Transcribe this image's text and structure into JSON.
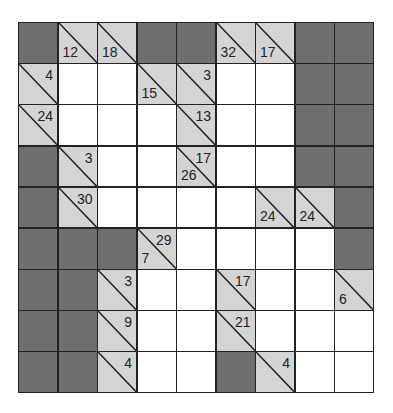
{
  "puzzle": {
    "type": "kakuro",
    "rows": 9,
    "cols": 9,
    "colors": {
      "block": "#6f6f6f",
      "clue": "#d4d4d4",
      "entry": "#ffffff",
      "line": "#222222"
    },
    "grid": [
      [
        {
          "t": "D"
        },
        {
          "t": "C",
          "down": "12"
        },
        {
          "t": "C",
          "down": "18"
        },
        {
          "t": "D"
        },
        {
          "t": "D"
        },
        {
          "t": "C",
          "down": "32"
        },
        {
          "t": "C",
          "down": "17"
        },
        {
          "t": "D"
        },
        {
          "t": "D"
        }
      ],
      [
        {
          "t": "C",
          "right": "4"
        },
        {
          "t": "W"
        },
        {
          "t": "W"
        },
        {
          "t": "C",
          "down": "15"
        },
        {
          "t": "C",
          "right": "3"
        },
        {
          "t": "W"
        },
        {
          "t": "W"
        },
        {
          "t": "D"
        },
        {
          "t": "D"
        }
      ],
      [
        {
          "t": "C",
          "right": "24"
        },
        {
          "t": "W"
        },
        {
          "t": "W"
        },
        {
          "t": "W"
        },
        {
          "t": "C",
          "right": "13"
        },
        {
          "t": "W"
        },
        {
          "t": "W"
        },
        {
          "t": "D"
        },
        {
          "t": "D"
        }
      ],
      [
        {
          "t": "D"
        },
        {
          "t": "C",
          "right": "3"
        },
        {
          "t": "W"
        },
        {
          "t": "W"
        },
        {
          "t": "C",
          "right": "17",
          "down": "26"
        },
        {
          "t": "W"
        },
        {
          "t": "W"
        },
        {
          "t": "D"
        },
        {
          "t": "D"
        }
      ],
      [
        {
          "t": "D"
        },
        {
          "t": "C",
          "right": "30"
        },
        {
          "t": "W"
        },
        {
          "t": "W"
        },
        {
          "t": "W"
        },
        {
          "t": "W"
        },
        {
          "t": "C",
          "down": "24"
        },
        {
          "t": "C",
          "down": "24"
        },
        {
          "t": "D"
        }
      ],
      [
        {
          "t": "D"
        },
        {
          "t": "D"
        },
        {
          "t": "D"
        },
        {
          "t": "C",
          "right": "29",
          "down": "7"
        },
        {
          "t": "W"
        },
        {
          "t": "W"
        },
        {
          "t": "W"
        },
        {
          "t": "W"
        },
        {
          "t": "D"
        }
      ],
      [
        {
          "t": "D"
        },
        {
          "t": "D"
        },
        {
          "t": "C",
          "right": "3"
        },
        {
          "t": "W"
        },
        {
          "t": "W"
        },
        {
          "t": "C",
          "right": "17"
        },
        {
          "t": "W"
        },
        {
          "t": "W"
        },
        {
          "t": "C",
          "down": "6"
        }
      ],
      [
        {
          "t": "D"
        },
        {
          "t": "D"
        },
        {
          "t": "C",
          "right": "9"
        },
        {
          "t": "W"
        },
        {
          "t": "W"
        },
        {
          "t": "C",
          "right": "21"
        },
        {
          "t": "W"
        },
        {
          "t": "W"
        },
        {
          "t": "W"
        }
      ],
      [
        {
          "t": "D"
        },
        {
          "t": "D"
        },
        {
          "t": "C",
          "right": "4"
        },
        {
          "t": "W"
        },
        {
          "t": "W"
        },
        {
          "t": "D"
        },
        {
          "t": "C",
          "right": "4"
        },
        {
          "t": "W"
        },
        {
          "t": "W"
        }
      ]
    ]
  }
}
